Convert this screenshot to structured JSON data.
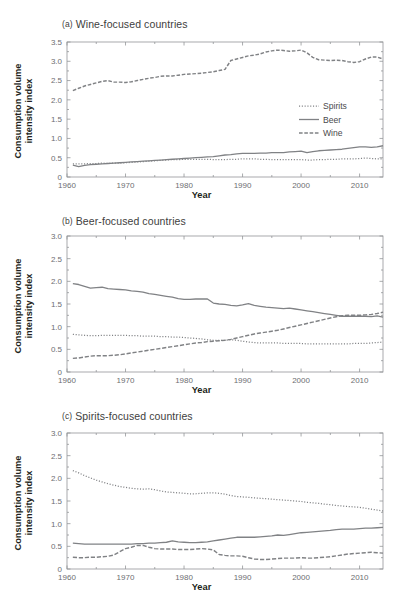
{
  "figure": {
    "axis_label_x": "Year",
    "axis_label_y": "Consumption volume\nintensity index",
    "ylabel_line1": "Consumption volume",
    "ylabel_line2": "intensity index",
    "line_color": "#808285",
    "text_color": "#58595b"
  },
  "legend": {
    "position": "right-middle-panel-a",
    "items": [
      {
        "label": "Spirits",
        "style": "dotted"
      },
      {
        "label": "Beer",
        "style": "solid"
      },
      {
        "label": "Wine",
        "style": "dash-dot"
      }
    ]
  },
  "panels": [
    {
      "id": "a",
      "tag": "(a)",
      "title": "Wine-focused countries"
    },
    {
      "id": "b",
      "tag": "(b)",
      "title": "Beer-focused countries"
    },
    {
      "id": "c",
      "tag": "(c)",
      "title": "Spirits-focused countries"
    }
  ],
  "chart_data": [
    {
      "type": "line",
      "panel": "a",
      "title": "(a)  Wine-focused countries",
      "xlabel": "Year",
      "ylabel": "Consumption volume intensity index",
      "xlim": [
        1960,
        2014
      ],
      "ylim": [
        0,
        3.5
      ],
      "xticks": [
        1960,
        1970,
        1980,
        1990,
        2000,
        2010
      ],
      "yticks": [
        0,
        0.5,
        1.0,
        1.5,
        2.0,
        2.5,
        3.0,
        3.5
      ],
      "ytick_labels": [
        "0",
        "0.5",
        "1.0",
        "1.5",
        "2.0",
        "2.5",
        "3.0",
        "3.5"
      ],
      "grid": false,
      "legend": [
        "Spirits",
        "Beer",
        "Wine"
      ],
      "x": [
        1961,
        1962,
        1963,
        1964,
        1965,
        1966,
        1967,
        1968,
        1969,
        1970,
        1971,
        1972,
        1973,
        1974,
        1975,
        1976,
        1977,
        1978,
        1979,
        1980,
        1981,
        1982,
        1983,
        1984,
        1985,
        1986,
        1987,
        1988,
        1989,
        1990,
        1991,
        1992,
        1993,
        1994,
        1995,
        1996,
        1997,
        1998,
        1999,
        2000,
        2001,
        2002,
        2003,
        2004,
        2005,
        2006,
        2007,
        2008,
        2009,
        2010,
        2011,
        2012,
        2013,
        2014
      ],
      "series": [
        {
          "name": "Wine",
          "style": "dash-dot",
          "values": [
            2.24,
            2.3,
            2.36,
            2.4,
            2.44,
            2.48,
            2.5,
            2.46,
            2.46,
            2.45,
            2.47,
            2.5,
            2.53,
            2.56,
            2.58,
            2.61,
            2.62,
            2.62,
            2.64,
            2.66,
            2.67,
            2.68,
            2.69,
            2.71,
            2.73,
            2.76,
            2.79,
            3.02,
            3.06,
            3.1,
            3.14,
            3.16,
            3.19,
            3.24,
            3.27,
            3.29,
            3.28,
            3.26,
            3.27,
            3.29,
            3.22,
            3.1,
            3.04,
            3.03,
            3.02,
            3.03,
            3.02,
            2.99,
            2.97,
            2.99,
            3.06,
            3.11,
            3.11,
            3.06
          ]
        },
        {
          "name": "Beer",
          "style": "solid",
          "values": [
            0.31,
            0.27,
            0.3,
            0.32,
            0.33,
            0.34,
            0.35,
            0.36,
            0.37,
            0.38,
            0.39,
            0.4,
            0.41,
            0.42,
            0.43,
            0.44,
            0.45,
            0.46,
            0.47,
            0.48,
            0.49,
            0.5,
            0.51,
            0.52,
            0.53,
            0.55,
            0.57,
            0.58,
            0.6,
            0.61,
            0.61,
            0.61,
            0.62,
            0.62,
            0.63,
            0.63,
            0.63,
            0.65,
            0.66,
            0.67,
            0.63,
            0.66,
            0.68,
            0.69,
            0.7,
            0.71,
            0.72,
            0.74,
            0.76,
            0.78,
            0.78,
            0.77,
            0.78,
            0.81
          ]
        },
        {
          "name": "Spirits",
          "style": "dotted",
          "values": [
            0.34,
            0.34,
            0.34,
            0.35,
            0.35,
            0.36,
            0.35,
            0.36,
            0.36,
            0.37,
            0.38,
            0.39,
            0.4,
            0.41,
            0.42,
            0.43,
            0.44,
            0.45,
            0.45,
            0.46,
            0.46,
            0.46,
            0.46,
            0.46,
            0.45,
            0.45,
            0.45,
            0.46,
            0.46,
            0.47,
            0.47,
            0.47,
            0.46,
            0.46,
            0.45,
            0.45,
            0.45,
            0.45,
            0.45,
            0.45,
            0.44,
            0.44,
            0.45,
            0.45,
            0.46,
            0.46,
            0.47,
            0.47,
            0.47,
            0.48,
            0.49,
            0.48,
            0.47,
            0.47
          ]
        }
      ]
    },
    {
      "type": "line",
      "panel": "b",
      "title": "(b)  Beer-focused countries",
      "xlabel": "Year",
      "ylabel": "Consumption volume intensity index",
      "xlim": [
        1960,
        2014
      ],
      "ylim": [
        0,
        3.0
      ],
      "xticks": [
        1960,
        1970,
        1980,
        1990,
        2000,
        2010
      ],
      "yticks": [
        0,
        0.5,
        1.0,
        1.5,
        2.0,
        2.5,
        3.0
      ],
      "ytick_labels": [
        "0",
        "0.5",
        "1.0",
        "1.5",
        "2.0",
        "2.5",
        "3.0"
      ],
      "grid": false,
      "legend": [
        "Spirits",
        "Beer",
        "Wine"
      ],
      "x": [
        1961,
        1962,
        1963,
        1964,
        1965,
        1966,
        1967,
        1968,
        1969,
        1970,
        1971,
        1972,
        1973,
        1974,
        1975,
        1976,
        1977,
        1978,
        1979,
        1980,
        1981,
        1982,
        1983,
        1984,
        1985,
        1986,
        1987,
        1988,
        1989,
        1990,
        1991,
        1992,
        1993,
        1994,
        1995,
        1996,
        1997,
        1998,
        1999,
        2000,
        2001,
        2002,
        2003,
        2004,
        2005,
        2006,
        2007,
        2008,
        2009,
        2010,
        2011,
        2012,
        2013,
        2014
      ],
      "series": [
        {
          "name": "Beer",
          "style": "solid",
          "values": [
            1.95,
            1.93,
            1.89,
            1.85,
            1.86,
            1.87,
            1.84,
            1.83,
            1.82,
            1.81,
            1.79,
            1.78,
            1.76,
            1.73,
            1.71,
            1.69,
            1.67,
            1.65,
            1.62,
            1.6,
            1.6,
            1.61,
            1.61,
            1.61,
            1.52,
            1.5,
            1.49,
            1.47,
            1.46,
            1.48,
            1.51,
            1.47,
            1.45,
            1.43,
            1.42,
            1.41,
            1.4,
            1.41,
            1.39,
            1.37,
            1.35,
            1.33,
            1.31,
            1.29,
            1.27,
            1.25,
            1.23,
            1.23,
            1.23,
            1.23,
            1.23,
            1.22,
            1.24,
            1.21
          ]
        },
        {
          "name": "Spirits",
          "style": "dotted",
          "values": [
            0.83,
            0.82,
            0.81,
            0.8,
            0.8,
            0.81,
            0.81,
            0.81,
            0.81,
            0.81,
            0.8,
            0.8,
            0.79,
            0.79,
            0.79,
            0.78,
            0.78,
            0.77,
            0.77,
            0.76,
            0.75,
            0.74,
            0.73,
            0.71,
            0.7,
            0.7,
            0.7,
            0.71,
            0.7,
            0.68,
            0.66,
            0.65,
            0.64,
            0.64,
            0.64,
            0.64,
            0.63,
            0.63,
            0.63,
            0.63,
            0.62,
            0.62,
            0.62,
            0.62,
            0.62,
            0.62,
            0.62,
            0.62,
            0.63,
            0.63,
            0.63,
            0.64,
            0.65,
            0.66
          ]
        },
        {
          "name": "Wine",
          "style": "dash-dot",
          "values": [
            0.3,
            0.31,
            0.33,
            0.35,
            0.36,
            0.36,
            0.36,
            0.37,
            0.38,
            0.4,
            0.42,
            0.44,
            0.46,
            0.48,
            0.5,
            0.52,
            0.54,
            0.56,
            0.58,
            0.6,
            0.62,
            0.64,
            0.65,
            0.67,
            0.68,
            0.69,
            0.7,
            0.72,
            0.75,
            0.78,
            0.81,
            0.84,
            0.86,
            0.88,
            0.9,
            0.92,
            0.95,
            0.98,
            1.01,
            1.04,
            1.07,
            1.1,
            1.13,
            1.16,
            1.19,
            1.22,
            1.24,
            1.25,
            1.25,
            1.25,
            1.26,
            1.27,
            1.29,
            1.32
          ]
        }
      ]
    },
    {
      "type": "line",
      "panel": "c",
      "title": "(c)  Spirits-focused countries",
      "xlabel": "Year",
      "ylabel": "Consumption volume intensity index",
      "xlim": [
        1960,
        2014
      ],
      "ylim": [
        0,
        3.0
      ],
      "xticks": [
        1960,
        1970,
        1980,
        1990,
        2000,
        2010
      ],
      "yticks": [
        0,
        0.5,
        1.0,
        1.5,
        2.0,
        2.5,
        3.0
      ],
      "ytick_labels": [
        "0",
        "0.5",
        "1.0",
        "1.5",
        "2.0",
        "2.5",
        "3.0"
      ],
      "grid": false,
      "legend": [
        "Spirits",
        "Beer",
        "Wine"
      ],
      "x": [
        1961,
        1962,
        1963,
        1964,
        1965,
        1966,
        1967,
        1968,
        1969,
        1970,
        1971,
        1972,
        1973,
        1974,
        1975,
        1976,
        1977,
        1978,
        1979,
        1980,
        1981,
        1982,
        1983,
        1984,
        1985,
        1986,
        1987,
        1988,
        1989,
        1990,
        1991,
        1992,
        1993,
        1994,
        1995,
        1996,
        1997,
        1998,
        1999,
        2000,
        2001,
        2002,
        2003,
        2004,
        2005,
        2006,
        2007,
        2008,
        2009,
        2010,
        2011,
        2012,
        2013,
        2014
      ],
      "series": [
        {
          "name": "Spirits",
          "style": "dotted",
          "values": [
            2.17,
            2.12,
            2.06,
            2.01,
            1.96,
            1.92,
            1.88,
            1.85,
            1.82,
            1.8,
            1.78,
            1.77,
            1.76,
            1.77,
            1.75,
            1.72,
            1.7,
            1.69,
            1.68,
            1.67,
            1.66,
            1.66,
            1.67,
            1.68,
            1.68,
            1.67,
            1.65,
            1.62,
            1.6,
            1.59,
            1.58,
            1.57,
            1.56,
            1.55,
            1.54,
            1.53,
            1.52,
            1.51,
            1.5,
            1.49,
            1.47,
            1.46,
            1.45,
            1.43,
            1.42,
            1.4,
            1.39,
            1.38,
            1.37,
            1.36,
            1.34,
            1.32,
            1.3,
            1.28
          ]
        },
        {
          "name": "Beer",
          "style": "solid",
          "values": [
            0.57,
            0.56,
            0.55,
            0.55,
            0.55,
            0.55,
            0.55,
            0.55,
            0.55,
            0.55,
            0.55,
            0.56,
            0.56,
            0.57,
            0.57,
            0.58,
            0.59,
            0.62,
            0.6,
            0.59,
            0.58,
            0.58,
            0.59,
            0.6,
            0.62,
            0.64,
            0.66,
            0.68,
            0.7,
            0.7,
            0.7,
            0.7,
            0.71,
            0.72,
            0.73,
            0.75,
            0.74,
            0.76,
            0.78,
            0.8,
            0.81,
            0.82,
            0.83,
            0.84,
            0.85,
            0.87,
            0.88,
            0.88,
            0.88,
            0.89,
            0.9,
            0.9,
            0.91,
            0.92
          ]
        },
        {
          "name": "Wine",
          "style": "dash-dot",
          "values": [
            0.26,
            0.25,
            0.25,
            0.26,
            0.26,
            0.27,
            0.28,
            0.31,
            0.38,
            0.45,
            0.48,
            0.52,
            0.52,
            0.48,
            0.45,
            0.44,
            0.44,
            0.44,
            0.43,
            0.43,
            0.43,
            0.44,
            0.45,
            0.44,
            0.42,
            0.32,
            0.3,
            0.29,
            0.29,
            0.28,
            0.25,
            0.22,
            0.21,
            0.21,
            0.22,
            0.23,
            0.24,
            0.24,
            0.24,
            0.25,
            0.24,
            0.24,
            0.25,
            0.26,
            0.27,
            0.29,
            0.31,
            0.33,
            0.34,
            0.35,
            0.36,
            0.37,
            0.36,
            0.35
          ]
        }
      ]
    }
  ]
}
